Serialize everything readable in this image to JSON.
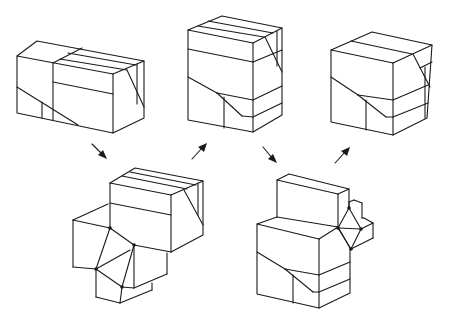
{
  "diagram": {
    "stroke_color": "#1a1a1a",
    "background": "#ffffff",
    "figures": [
      {
        "id": "box-1",
        "label": "",
        "position": "top-left"
      },
      {
        "id": "box-2",
        "label": "",
        "position": "top-center"
      },
      {
        "id": "box-3",
        "label": "",
        "position": "top-right"
      },
      {
        "id": "assembly-1",
        "label": "",
        "position": "bottom-left",
        "hinge_points": 4
      },
      {
        "id": "assembly-2",
        "label": "",
        "position": "bottom-right",
        "hinge_points": 4
      }
    ],
    "arrows": [
      {
        "from": "box-1",
        "to": "assembly-1",
        "direction": "down-right"
      },
      {
        "from": "assembly-1",
        "to": "box-2",
        "direction": "up-right"
      },
      {
        "from": "box-2",
        "to": "assembly-2",
        "direction": "down-right"
      },
      {
        "from": "assembly-2",
        "to": "box-3",
        "direction": "up-right"
      }
    ]
  }
}
